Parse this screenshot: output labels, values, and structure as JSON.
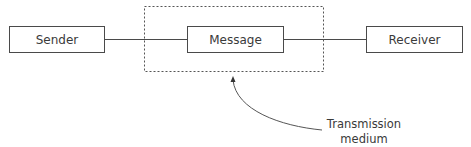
{
  "diagram": {
    "nodes": [
      {
        "id": "sender",
        "label": "Sender"
      },
      {
        "id": "message",
        "label": "Message"
      },
      {
        "id": "receiver",
        "label": "Receiver"
      }
    ],
    "edges": [
      {
        "from": "sender",
        "to": "message"
      },
      {
        "from": "message",
        "to": "receiver"
      }
    ],
    "group": {
      "label_line1": "Transmission",
      "label_line2": "medium",
      "encloses": "message",
      "style": "dashed"
    },
    "colors": {
      "line": "#4a4a4a",
      "dashed": "#555555",
      "text": "#3a3a3a",
      "background": "#ffffff"
    }
  }
}
